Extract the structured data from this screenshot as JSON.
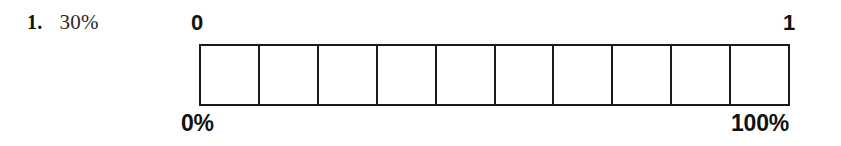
{
  "page": {
    "background_color": "#ffffff",
    "ink_color": "#1a1a1a",
    "width": 841,
    "height": 146
  },
  "question": {
    "number": "1.",
    "value": "30%"
  },
  "diagram": {
    "type": "percent-strip-bar",
    "cell_count": 10,
    "cells_shaded": 0,
    "cell_fill_color": "#ffffff",
    "border_color": "#1a1a1a",
    "labels": {
      "top_start": "0",
      "top_end": "1",
      "bottom_start": "0%",
      "bottom_end": "100%"
    },
    "cells": [
      {
        "index": 1,
        "shaded": false
      },
      {
        "index": 2,
        "shaded": false
      },
      {
        "index": 3,
        "shaded": false
      },
      {
        "index": 4,
        "shaded": false
      },
      {
        "index": 5,
        "shaded": false
      },
      {
        "index": 6,
        "shaded": false
      },
      {
        "index": 7,
        "shaded": false
      },
      {
        "index": 8,
        "shaded": false
      },
      {
        "index": 9,
        "shaded": false
      },
      {
        "index": 10,
        "shaded": false
      }
    ]
  }
}
